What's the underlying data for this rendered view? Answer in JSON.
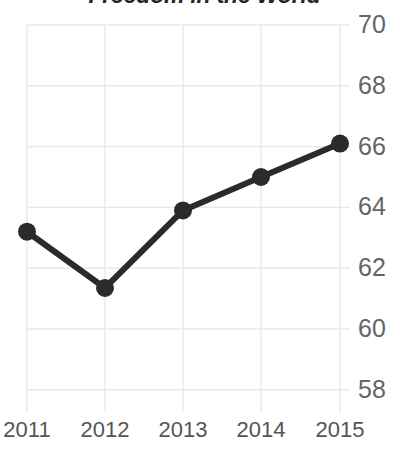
{
  "chart_data": {
    "type": "line",
    "title": "Freedom in the World",
    "title_clipped": true,
    "xlabel": "",
    "ylabel": "",
    "categories": [
      "2011",
      "2012",
      "2013",
      "2014",
      "2015"
    ],
    "x_tick_labels": [
      "2011",
      "2012",
      "2013",
      "2014",
      "2015"
    ],
    "y_tick_labels": [
      "70",
      "68",
      "66",
      "64",
      "62",
      "60",
      "58"
    ],
    "y_ticks": [
      70,
      68,
      66,
      64,
      62,
      60,
      58
    ],
    "ylim": [
      57.5,
      70.5
    ],
    "xlim": [
      2010.7,
      2015.3
    ],
    "grid": true,
    "grid_color": "#e8e8e8",
    "y_axis_position": "right",
    "legend": "none",
    "series": [
      {
        "name": "Score",
        "color": "#2b2b2b",
        "line_width": 6,
        "marker": "circle",
        "marker_size": 9,
        "values": [
          63.2,
          61.35,
          63.9,
          65.0,
          66.1
        ]
      }
    ],
    "background_color": "#ffffff",
    "tick_label_color": "#656565"
  },
  "axes": {
    "y_labels": [
      {
        "text": "70",
        "value": 70
      },
      {
        "text": "68",
        "value": 68
      },
      {
        "text": "66",
        "value": 66
      },
      {
        "text": "64",
        "value": 64
      },
      {
        "text": "62",
        "value": 62
      },
      {
        "text": "60",
        "value": 60
      },
      {
        "text": "58",
        "value": 58
      }
    ],
    "x_labels": [
      {
        "text": "2011"
      },
      {
        "text": "2012"
      },
      {
        "text": "2013"
      },
      {
        "text": "2014"
      },
      {
        "text": "2015"
      }
    ]
  }
}
